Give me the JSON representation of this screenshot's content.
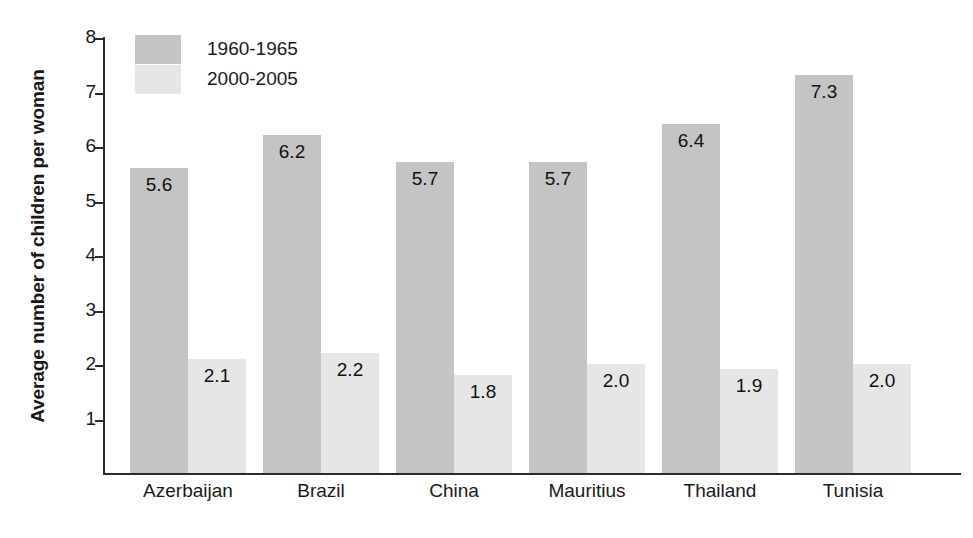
{
  "chart_data": {
    "type": "bar",
    "title": "",
    "xlabel": "",
    "ylabel": "Average number of children per woman",
    "ylim": [
      0,
      8
    ],
    "yticks": [
      "1",
      "2",
      "3",
      "4",
      "5",
      "6",
      "7",
      "8"
    ],
    "grid": false,
    "legend_position": "top-left-inside",
    "categories": [
      "Azerbaijan",
      "Brazil",
      "China",
      "Mauritius",
      "Thailand",
      "Tunisia"
    ],
    "series": [
      {
        "name": "1960-1965",
        "color": "#c4c4c4",
        "values": [
          5.6,
          6.2,
          5.7,
          5.7,
          6.4,
          7.3
        ],
        "labels": [
          "5.6",
          "6.2",
          "5.7",
          "5.7",
          "6.4",
          "7.3"
        ]
      },
      {
        "name": "2000-2005",
        "color": "#e6e6e6",
        "values": [
          2.1,
          2.2,
          1.8,
          2.0,
          1.9,
          2.0
        ],
        "labels": [
          "2.1",
          "2.2",
          "1.8",
          "2.0",
          "1.9",
          "2.0"
        ]
      }
    ]
  },
  "legend": {
    "items": [
      {
        "label": "1960-1965",
        "color": "#c4c4c4"
      },
      {
        "label": "2000-2005",
        "color": "#e6e6e6"
      }
    ]
  },
  "axes": {
    "y_title": "Average number of children per woman",
    "y_tick_labels": [
      "8",
      "7",
      "6",
      "5",
      "4",
      "3",
      "2",
      "1"
    ],
    "x_tick_labels": [
      "Azerbaijan",
      "Brazil",
      "China",
      "Mauritius",
      "Thailand",
      "Tunisia"
    ]
  }
}
